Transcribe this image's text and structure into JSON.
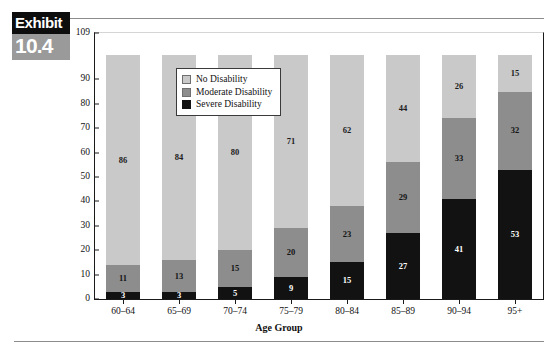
{
  "exhibit": {
    "word": "Exhibit",
    "number": "10.4"
  },
  "chart_data": {
    "type": "bar",
    "subtype": "stacked-bar-100",
    "title": "",
    "xlabel": "Age Group",
    "ylabel": "",
    "categories": [
      "60–64",
      "65–69",
      "70–74",
      "75–79",
      "80–84",
      "85–89",
      "90–94",
      "95+"
    ],
    "series": [
      {
        "name": "Severe Disability",
        "color": "#121212",
        "values": [
          3,
          3,
          5,
          9,
          15,
          27,
          41,
          53
        ]
      },
      {
        "name": "Moderate Disability",
        "color": "#8d8d8d",
        "values": [
          11,
          13,
          15,
          20,
          23,
          29,
          33,
          32
        ]
      },
      {
        "name": "No Disability",
        "color": "#c9c9c9",
        "values": [
          86,
          84,
          80,
          71,
          62,
          44,
          26,
          15
        ]
      }
    ],
    "stack_order_bottom_to_top": [
      "Severe Disability",
      "Moderate Disability",
      "No Disability"
    ],
    "ylim": [
      0,
      109
    ],
    "yticks": [
      0,
      10,
      20,
      30,
      40,
      50,
      60,
      70,
      80,
      90,
      109
    ],
    "ytick_labels": [
      "0",
      "10",
      "20",
      "30",
      "40",
      "50",
      "60",
      "70",
      "80",
      "90",
      "109"
    ],
    "grid": false,
    "legend_position": "upper-left-inside",
    "legend": [
      {
        "label": "No Disability",
        "color": "#c9c9c9"
      },
      {
        "label": "Moderate Disability",
        "color": "#8d8d8d"
      },
      {
        "label": "Severe Disability",
        "color": "#121212"
      }
    ]
  }
}
